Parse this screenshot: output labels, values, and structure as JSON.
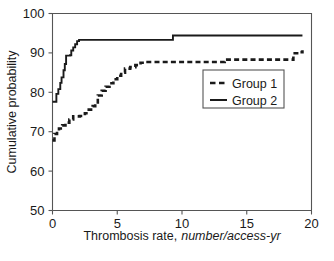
{
  "chart_data": {
    "type": "line",
    "title": "",
    "xlabel": "Thrombosis rate, number/access-yr",
    "xlabel_plain": "Thrombosis rate,",
    "xlabel_italic": "number/access-yr",
    "ylabel": "Cumulative probability",
    "xlim": [
      0,
      20
    ],
    "ylim": [
      50,
      100
    ],
    "xticks": [
      0,
      5,
      10,
      15,
      20
    ],
    "xtick_labels": [
      "0",
      "5",
      "10",
      "15",
      "20"
    ],
    "yticks": [
      50,
      60,
      70,
      80,
      90,
      100
    ],
    "ytick_labels": [
      "50",
      "60",
      "70",
      "80",
      "90",
      "100"
    ],
    "grid": false,
    "legend_position": "center-right",
    "interpolation": "step-post",
    "series": [
      {
        "name": "Group 1",
        "style": "dashed",
        "color": "#1a1a1a",
        "points": [
          [
            0.0,
            67.8
          ],
          [
            0.15,
            69.4
          ],
          [
            0.35,
            70.2
          ],
          [
            0.5,
            70.8
          ],
          [
            0.75,
            71.6
          ],
          [
            1.0,
            72.3
          ],
          [
            1.3,
            73.1
          ],
          [
            1.6,
            73.9
          ],
          [
            2.1,
            74.0
          ],
          [
            2.5,
            74.7
          ],
          [
            2.8,
            75.6
          ],
          [
            3.1,
            76.5
          ],
          [
            3.3,
            77.1
          ],
          [
            3.5,
            79.2
          ],
          [
            3.8,
            80.4
          ],
          [
            4.1,
            81.4
          ],
          [
            4.4,
            82.3
          ],
          [
            4.7,
            83.3
          ],
          [
            5.0,
            84.2
          ],
          [
            5.3,
            85.0
          ],
          [
            5.6,
            86.0
          ],
          [
            6.0,
            86.4
          ],
          [
            6.4,
            86.9
          ],
          [
            6.8,
            87.5
          ],
          [
            7.2,
            87.7
          ],
          [
            9.2,
            87.7
          ],
          [
            13.1,
            87.7
          ],
          [
            13.3,
            88.3
          ],
          [
            18.3,
            88.3
          ],
          [
            18.6,
            89.9
          ],
          [
            19.0,
            90.2
          ],
          [
            19.3,
            90.7
          ]
        ]
      },
      {
        "name": "Group 2",
        "style": "solid",
        "color": "#1a1a1a",
        "points": [
          [
            0.0,
            77.6
          ],
          [
            0.25,
            77.6
          ],
          [
            0.3,
            79.6
          ],
          [
            0.45,
            80.8
          ],
          [
            0.6,
            82.4
          ],
          [
            0.7,
            83.8
          ],
          [
            0.85,
            85.6
          ],
          [
            0.95,
            87.2
          ],
          [
            1.05,
            89.3
          ],
          [
            1.35,
            89.4
          ],
          [
            1.45,
            90.6
          ],
          [
            1.6,
            91.4
          ],
          [
            1.75,
            92.2
          ],
          [
            1.9,
            93.0
          ],
          [
            2.05,
            93.3
          ],
          [
            9.2,
            93.3
          ],
          [
            9.3,
            94.4
          ],
          [
            19.3,
            94.4
          ]
        ]
      }
    ],
    "legend": [
      {
        "label": "Group 1",
        "style": "dashed"
      },
      {
        "label": "Group 2",
        "style": "solid"
      }
    ]
  }
}
